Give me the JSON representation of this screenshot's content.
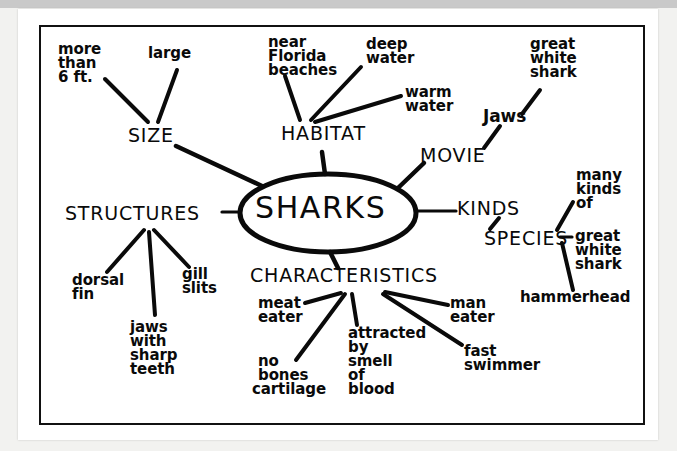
{
  "document": {
    "type": "scanned-worksheet",
    "background_color": "#f2f2f0",
    "paper_color": "#ffffff",
    "ink_color": "#0a0a0a"
  },
  "diagram": {
    "kind": "mind-map",
    "center": {
      "label": "SHARKS",
      "shape": "ellipse"
    },
    "branches": [
      {
        "label": "SIZE",
        "children": [
          {
            "label": "more\nthan\n6 ft."
          },
          {
            "label": "large"
          }
        ]
      },
      {
        "label": "HABITAT",
        "children": [
          {
            "label": "near\nFlorida\nbeaches"
          },
          {
            "label": "deep\nwater"
          },
          {
            "label": "warm\nwater"
          }
        ]
      },
      {
        "label": "MOVIE",
        "children": [
          {
            "label": "Jaws",
            "children": [
              {
                "label": "great\nwhite\nshark"
              }
            ]
          }
        ]
      },
      {
        "label": "KINDS",
        "children": [
          {
            "label": "SPECIES",
            "children": [
              {
                "label": "many\nkinds\nof"
              },
              {
                "label": "great\nwhite\nshark"
              },
              {
                "label": "hammerhead"
              }
            ]
          }
        ]
      },
      {
        "label": "CHARACTERISTICS",
        "children": [
          {
            "label": "meat\neater"
          },
          {
            "label": "no\nbones\ncartilage"
          },
          {
            "label": "attracted\nby\nsmell\nof\nblood"
          },
          {
            "label": "man\neater"
          },
          {
            "label": "fast\nswimmer"
          }
        ]
      },
      {
        "label": "STRUCTURES",
        "children": [
          {
            "label": "dorsal\nfin"
          },
          {
            "label": "jaws\nwith\nsharp\nteeth"
          },
          {
            "label": "gill\nslits"
          }
        ]
      }
    ]
  },
  "labels": {
    "center_sharks": "SHARKS",
    "size": "SIZE",
    "habitat": "HABITAT",
    "movie": "MOVIE",
    "kinds": "KINDS",
    "species": "SPECIES",
    "characteristics": "CHARACTERISTICS",
    "structures": "STRUCTURES",
    "more_than": "more",
    "more_than_2": "than",
    "more_than_3": "6 ft.",
    "large": "large",
    "near_florida_1": "near",
    "near_florida_2": "Florida",
    "near_florida_3": "beaches",
    "deep_water_1": "deep",
    "deep_water_2": "water",
    "warm_water_1": "warm",
    "warm_water_2": "water",
    "jaws_movie": "Jaws",
    "gws_movie_1": "great",
    "gws_movie_2": "white",
    "gws_movie_3": "shark",
    "many_kinds_1": "many",
    "many_kinds_2": "kinds",
    "many_kinds_3": "of",
    "gws_species_1": "great",
    "gws_species_2": "white",
    "gws_species_3": "shark",
    "hammerhead": "hammerhead",
    "meat_eater_1": "meat",
    "meat_eater_2": "eater",
    "no_bones_1": "no",
    "no_bones_2": "bones",
    "no_bones_3": "cartilage",
    "attracted_1": "attracted",
    "attracted_2": "by",
    "attracted_3": "smell",
    "attracted_4": "of",
    "attracted_5": "blood",
    "man_eater_1": "man",
    "man_eater_2": "eater",
    "fast_swimmer_1": "fast",
    "fast_swimmer_2": "swimmer",
    "dorsal_fin_1": "dorsal",
    "dorsal_fin_2": "fin",
    "gill_slits_1": "gill",
    "gill_slits_2": "slits",
    "jaws_teeth_1": "jaws",
    "jaws_teeth_2": "with",
    "jaws_teeth_3": "sharp",
    "jaws_teeth_4": "teeth"
  }
}
